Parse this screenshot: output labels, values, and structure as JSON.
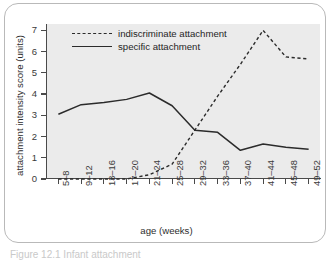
{
  "figure": {
    "caption": "Figure 12.1 Infant attachment"
  },
  "chart_data": {
    "type": "line",
    "title": "",
    "xlabel": "age (weeks)",
    "ylabel": "attachment intensity score (units)",
    "categories": [
      "5–8",
      "9–12",
      "13–16",
      "17–20",
      "21–24",
      "25–28",
      "29–32",
      "33–36",
      "37–40",
      "41–44",
      "45–48",
      "49–52"
    ],
    "yticks": [
      0,
      1,
      2,
      3,
      4,
      5,
      6,
      7
    ],
    "ylim": [
      0,
      7.3
    ],
    "grid": false,
    "legend_position": "top-left",
    "series": [
      {
        "name": "indiscriminate attachment",
        "style": "dashed",
        "color": "#2b2b2b",
        "values": [
          3.05,
          3.5,
          3.6,
          3.75,
          4.05,
          3.45,
          2.3,
          2.2,
          1.35,
          1.65,
          1.5,
          1.4
        ]
      },
      {
        "name": "specific attachment",
        "style": "solid",
        "color": "#2b2b2b",
        "values": [
          0,
          0,
          0,
          0,
          0.2,
          0.7,
          2.3,
          3.9,
          5.4,
          7.0,
          5.75,
          5.65
        ]
      }
    ]
  },
  "legend": {
    "items": [
      {
        "label": "indiscriminate attachment",
        "style": "dashed"
      },
      {
        "label": "specific attachment",
        "style": "solid"
      }
    ]
  },
  "colors": {
    "plot_background": "#ebebeb",
    "axis": "#4a4a4a",
    "frame": "#b9b9b9",
    "series": "#2b2b2b"
  }
}
